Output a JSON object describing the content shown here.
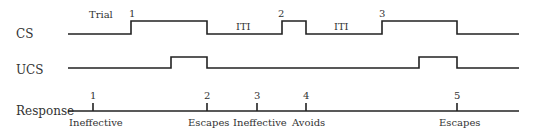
{
  "diagram": {
    "rows": [
      {
        "id": "cs",
        "label": "CS"
      },
      {
        "id": "ucs",
        "label": "UCS"
      },
      {
        "id": "response",
        "label": "Response"
      }
    ],
    "annotations": {
      "trial": "Trial",
      "iti_1": "ITI",
      "iti_2": "ITI"
    },
    "cs_trial_numbers": [
      "1",
      "2",
      "3"
    ],
    "response_markers": [
      {
        "number": "1",
        "outcome": "Ineffective"
      },
      {
        "number": "2",
        "outcome": "Escapes"
      },
      {
        "number": "3",
        "outcome": "Ineffective"
      },
      {
        "number": "4",
        "outcome": "Avoids"
      },
      {
        "number": "5",
        "outcome": "Escapes"
      }
    ],
    "colors": {
      "line": "#222222",
      "text": "#333333",
      "background": "#ffffff"
    }
  }
}
